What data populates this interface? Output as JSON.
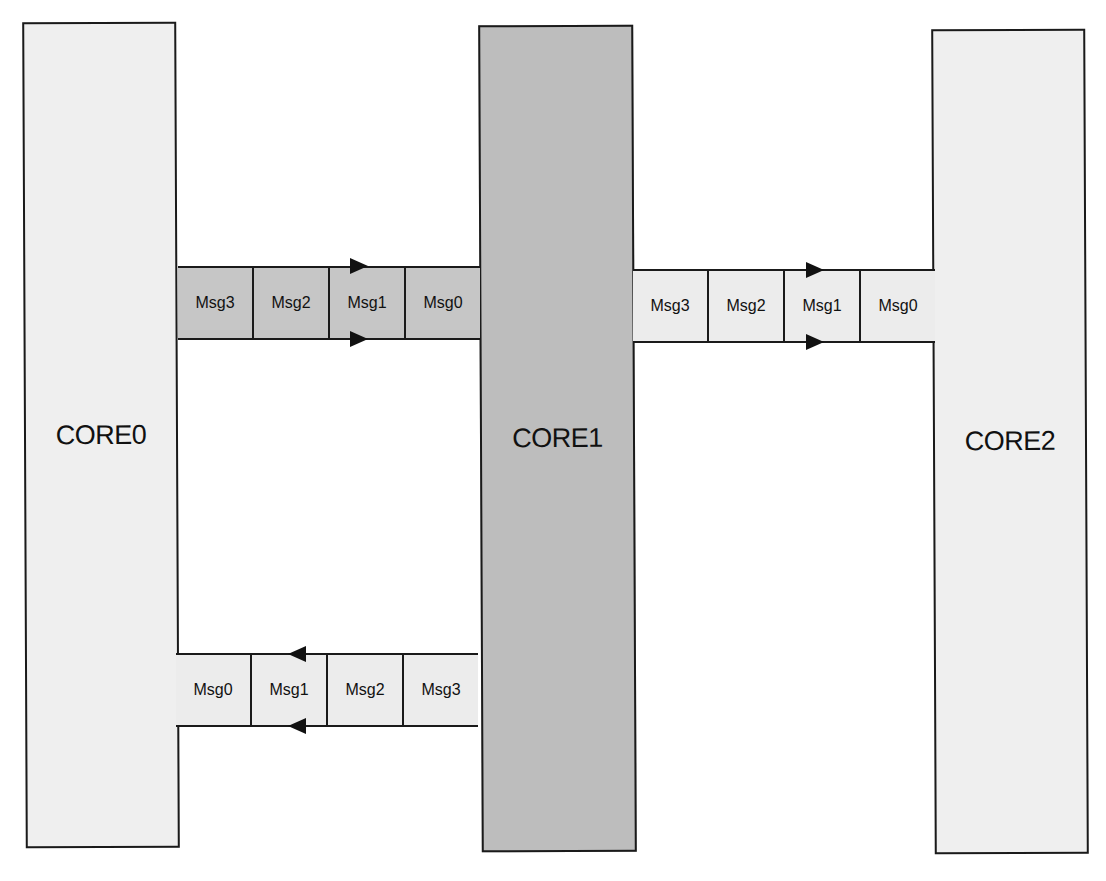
{
  "colors": {
    "core_light": "#efefef",
    "core_dark": "#bdbdbd",
    "queue_dark": "#c6c6c6",
    "queue_light": "#ececec",
    "border": "#1a1a1a"
  },
  "cores": [
    {
      "label": "CORE0"
    },
    {
      "label": "CORE1"
    },
    {
      "label": "CORE2"
    }
  ],
  "queues": {
    "core0_to_core1": {
      "direction": "right",
      "cells": [
        "Msg3",
        "Msg2",
        "Msg1",
        "Msg0"
      ]
    },
    "core1_to_core2": {
      "direction": "right",
      "cells": [
        "Msg3",
        "Msg2",
        "Msg1",
        "Msg0"
      ]
    },
    "core1_to_core0": {
      "direction": "left",
      "cells": [
        "Msg0",
        "Msg1",
        "Msg2",
        "Msg3"
      ]
    }
  }
}
